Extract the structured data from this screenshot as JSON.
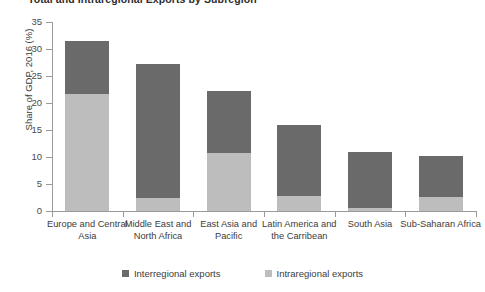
{
  "chart_data": {
    "type": "bar",
    "title": "Total and Intraregional Exports by Subregion",
    "xlabel": "",
    "ylabel": "Share of GDP, 2016 (%)",
    "ylim": [
      0,
      35
    ],
    "yticks": [
      0,
      5,
      10,
      15,
      20,
      25,
      30,
      35
    ],
    "grid": false,
    "stacked": true,
    "legend_position": "bottom",
    "categories": [
      "Europe and Central Asia",
      "Middle East and North Africa",
      "East Asia and Pacific",
      "Latin America and the Carribean",
      "South Asia",
      "Sub-Saharan Africa"
    ],
    "series": [
      {
        "name": "Intraregional exports",
        "color": "#bdbdbd",
        "values": [
          21.6,
          2.5,
          10.8,
          2.7,
          0.6,
          2.6
        ]
      },
      {
        "name": "Interregional exports",
        "color": "#6a6a6a",
        "values": [
          9.8,
          24.8,
          11.4,
          13.3,
          10.4,
          7.5
        ]
      }
    ],
    "totals": [
      31.4,
      27.3,
      22.2,
      16.0,
      11.0,
      10.1
    ]
  },
  "legend": {
    "items": [
      {
        "label": "Interregional exports",
        "color": "#6a6a6a"
      },
      {
        "label": "Intraregional exports",
        "color": "#bdbdbd"
      }
    ]
  },
  "colors": {
    "interregional": "#6a6a6a",
    "intraregional": "#bdbdbd",
    "axis": "#9a9a9a",
    "text": "#3c3c3c",
    "background": "#ffffff"
  }
}
